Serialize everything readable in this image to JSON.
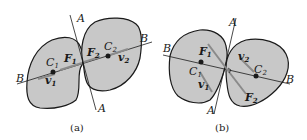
{
  "diagram": {
    "panels": [
      {
        "caption": "(a)",
        "labels": {
          "line_normal_top": "A",
          "line_normal_bottom": "A",
          "line_centers_left": "B",
          "line_centers_right": "B",
          "center1": "C",
          "center1_sub": "1",
          "center2": "C",
          "center2_sub": "2",
          "force1": "F",
          "force1_sub": "1",
          "force2": "F",
          "force2_sub": "2",
          "vel1": "v",
          "vel1_sub": "1",
          "vel2": "v",
          "vel2_sub": "2"
        }
      },
      {
        "caption": "(b)",
        "labels": {
          "line_normal_top": "A",
          "line_normal_bottom": "A",
          "line_centers_left": "B",
          "line_centers_right": "B",
          "center1": "C",
          "center1_sub": "1",
          "center2": "C",
          "center2_sub": "2",
          "force1": "F",
          "force1_sub": "1",
          "force2": "F",
          "force2_sub": "2",
          "vel1": "v",
          "vel1_sub": "1",
          "vel2": "v",
          "vel2_sub": "2"
        }
      }
    ],
    "colors": {
      "body_fill": "#c8c8c8",
      "outline": "#1a1a1a",
      "arrow": "#8a8a8a"
    }
  }
}
